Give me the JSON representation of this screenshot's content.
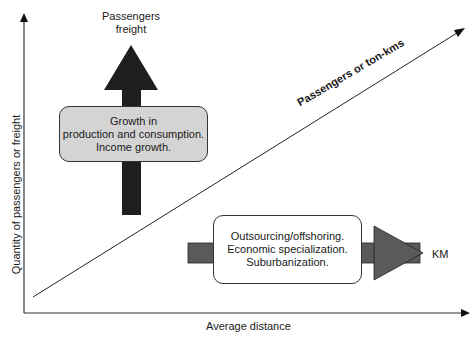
{
  "diagram": {
    "axes": {
      "y_label": "Quantity of passengers or freight",
      "x_label": "Average distance"
    },
    "diagonal": {
      "label": "Passengers or ton-kms"
    },
    "vertical_arrow": {
      "top_label_line1": "Passengers",
      "top_label_line2": "freight",
      "color": "#1e1e1e"
    },
    "growth_box": {
      "line1": "Growth in",
      "line2": "production and consumption.",
      "line3": "Income growth.",
      "fill": "#d4d4d4"
    },
    "horizontal_arrow": {
      "end_label": "KM",
      "color": "#5a5a5a"
    },
    "outsourcing_box": {
      "line1": "Outsourcing/offshoring.",
      "line2": "Economic specialization.",
      "line3": "Suburbanization.",
      "fill": "#ffffff"
    }
  }
}
